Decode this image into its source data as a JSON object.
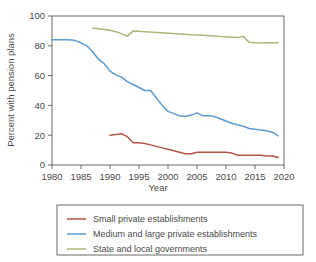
{
  "chart_data": {
    "type": "line",
    "title": "",
    "xlabel": "Year",
    "ylabel": "Percent with pension plans",
    "xlim": [
      1980,
      2020
    ],
    "ylim": [
      0,
      100
    ],
    "xticks": [
      1980,
      1985,
      1990,
      1995,
      2000,
      2005,
      2010,
      2015,
      2020
    ],
    "yticks": [
      0,
      20,
      40,
      60,
      80,
      100
    ],
    "grid": false,
    "legend_position": "below",
    "series": [
      {
        "name": "Small private establishments",
        "color": "#b5564a",
        "x": [
          1990,
          1991,
          1992,
          1993,
          1994,
          1995,
          1996,
          1997,
          1998,
          1999,
          2000,
          2001,
          2002,
          2003,
          2004,
          2005,
          2006,
          2007,
          2008,
          2009,
          2010,
          2011,
          2012,
          2013,
          2014,
          2015,
          2016,
          2017,
          2018,
          2019
        ],
        "values": [
          20,
          20.5,
          21,
          19,
          15,
          15,
          14.5,
          13.5,
          12.5,
          11.5,
          10.5,
          9.5,
          8.5,
          7.5,
          7.5,
          8.5,
          8.5,
          8.5,
          8.5,
          8.5,
          8.5,
          8,
          6.5,
          6.5,
          6.5,
          6.5,
          6.5,
          6,
          6,
          5
        ]
      },
      {
        "name": "Medium and large private establishments",
        "color": "#5b9bd1",
        "x": [
          1980,
          1981,
          1982,
          1983,
          1984,
          1985,
          1986,
          1987,
          1988,
          1989,
          1990,
          1991,
          1992,
          1993,
          1994,
          1995,
          1996,
          1997,
          1998,
          1999,
          2000,
          2001,
          2002,
          2003,
          2004,
          2005,
          2006,
          2007,
          2008,
          2009,
          2010,
          2011,
          2012,
          2013,
          2014,
          2015,
          2016,
          2017,
          2018,
          2019
        ],
        "values": [
          84,
          84,
          84,
          84,
          83.5,
          82,
          80,
          76,
          71,
          68,
          63,
          60.5,
          59,
          56,
          54,
          52,
          50,
          50,
          45,
          40,
          36,
          34.5,
          33,
          32.5,
          33.5,
          35,
          33,
          33,
          32.5,
          31,
          29.5,
          28,
          27,
          26,
          24.5,
          24,
          23.5,
          23,
          22,
          19.5
        ]
      },
      {
        "name": "State and local governments",
        "color": "#a8b878",
        "x": [
          1987,
          1988,
          1989,
          1990,
          1991,
          1992,
          1993,
          1994,
          1995,
          1996,
          1997,
          1998,
          1999,
          2000,
          2001,
          2002,
          2003,
          2004,
          2005,
          2006,
          2007,
          2008,
          2009,
          2010,
          2011,
          2012,
          2013,
          2014,
          2015,
          2016,
          2017,
          2018,
          2019
        ],
        "values": [
          92,
          91.5,
          91,
          90.5,
          89.5,
          88,
          86.5,
          90,
          89.8,
          89.5,
          89.2,
          89,
          88.8,
          88.5,
          88.2,
          88,
          87.7,
          87.4,
          87.2,
          87,
          86.8,
          86.5,
          86.2,
          86,
          85.8,
          85.5,
          86.3,
          82.3,
          82,
          81.8,
          82,
          82,
          82
        ]
      }
    ]
  },
  "legend": {
    "entries": [
      {
        "label": "Small private establishments"
      },
      {
        "label": "Medium and large private establishments"
      },
      {
        "label": "State and local governments"
      }
    ]
  },
  "axis": {
    "x_title": "Year",
    "y_title": "Percent with pension plans",
    "x_tick_labels": [
      "1980",
      "1985",
      "1990",
      "1995",
      "2000",
      "2005",
      "2010",
      "2015",
      "2020"
    ],
    "y_tick_labels": [
      "0",
      "20",
      "40",
      "60",
      "80",
      "100"
    ]
  }
}
